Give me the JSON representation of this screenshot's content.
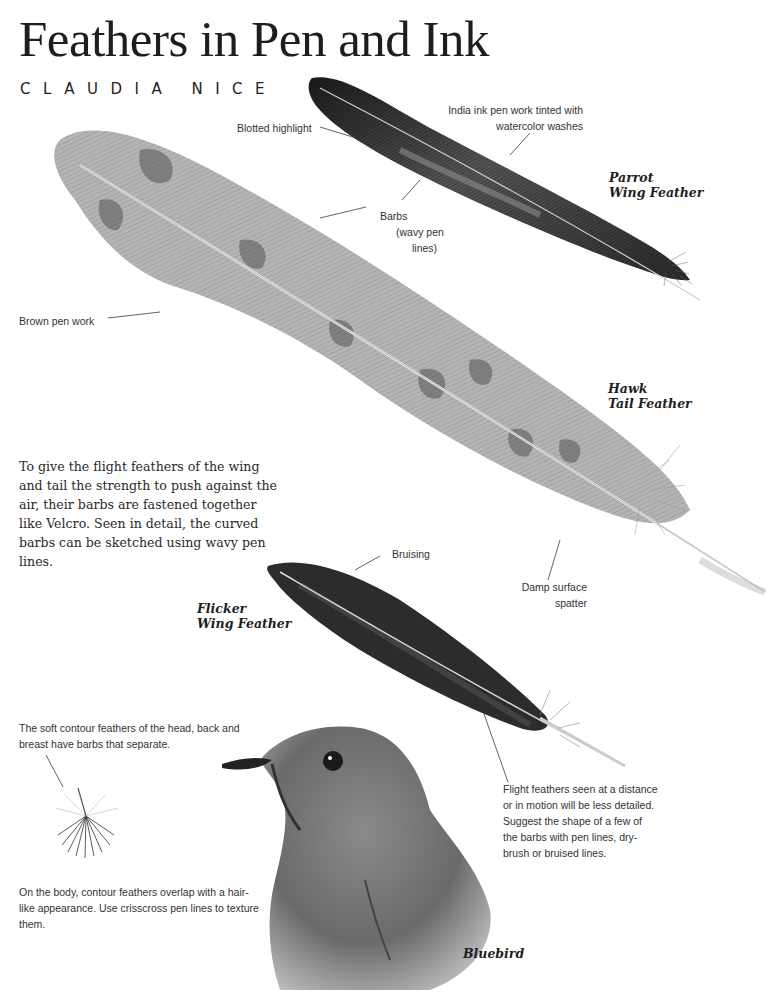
{
  "page": {
    "title": "Feathers in Pen and Ink",
    "author": "CLAUDIA NICE"
  },
  "species_labels": {
    "parrot": [
      "Parrot",
      "Wing Feather"
    ],
    "hawk": [
      "Hawk",
      "Tail Feather"
    ],
    "flicker": [
      "Flicker",
      "Wing Feather"
    ],
    "bluebird": "Bluebird"
  },
  "annotations": {
    "india_ink": [
      "India ink pen work tinted with",
      "watercolor washes"
    ],
    "blotted_highlight": "Blotted highlight",
    "barbs": [
      "Barbs",
      "(wavy pen",
      "lines)"
    ],
    "brown_pen_work": "Brown pen work",
    "bruising": "Bruising",
    "damp_surface": [
      "Damp surface",
      "spatter"
    ],
    "contour_feathers": [
      "The soft contour feathers of the head, back and",
      "breast have barbs that separate."
    ],
    "flight_feathers_distance": [
      "Flight feathers seen at a distance",
      "or in motion will be less detailed.",
      "Suggest the shape of a few of",
      "the barbs with pen lines, dry-",
      "brush or bruised lines."
    ],
    "body_contour": [
      "On the body, contour feathers overlap with a hair-",
      "like appearance. Use crisscross pen lines to texture",
      "them."
    ]
  },
  "body_paragraph": [
    "To give the flight feathers of the wing",
    "and tail the strength to push against the",
    "air, their barbs are fastened together",
    "like Velcro. Seen in detail, the curved",
    "barbs can be sketched using wavy pen",
    "lines."
  ],
  "colors": {
    "ink": "#1e1e1e",
    "parrot_feather": "#2b2b2b",
    "hawk_feather": "#9a9a9a",
    "flicker_feather": "#2e2e2e",
    "bluebird": "#6e6e6e"
  }
}
